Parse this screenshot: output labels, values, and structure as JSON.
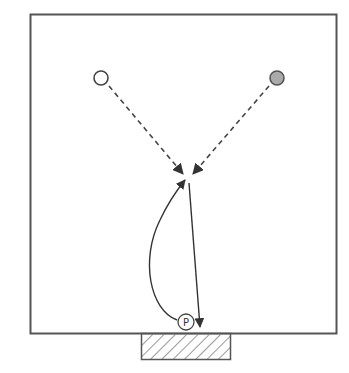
{
  "diagram": {
    "type": "play-diagram",
    "court": {
      "x": 30,
      "y": 14,
      "width": 306,
      "height": 319,
      "stroke": "#555555"
    },
    "goal_zone": {
      "x": 141,
      "y": 333,
      "width": 89,
      "height": 26,
      "pattern": "hatched",
      "stroke": "#555555"
    },
    "players": [
      {
        "id": "white-player",
        "cx": 101,
        "cy": 78,
        "r": 7,
        "fill": "#ffffff",
        "stroke": "#444444"
      },
      {
        "id": "gray-player",
        "cx": 277,
        "cy": 78,
        "r": 7,
        "fill": "#aaaaaa",
        "stroke": "#555555"
      },
      {
        "id": "p-player",
        "cx": 186,
        "cy": 322,
        "r": 8,
        "fill": "#ffffff",
        "stroke": "#444444",
        "label": "P"
      }
    ],
    "paths": [
      {
        "id": "dashed-from-white",
        "style": "dashed",
        "from": [
          109,
          86
        ],
        "to": [
          184,
          175
        ]
      },
      {
        "id": "dashed-from-gray",
        "style": "dashed",
        "from": [
          269,
          86
        ],
        "to": [
          192,
          175
        ]
      },
      {
        "id": "curved-pass",
        "style": "solid-curve",
        "from": [
          177,
          320
        ],
        "to": [
          185,
          180
        ]
      },
      {
        "id": "straight-shot",
        "style": "solid",
        "from": [
          189,
          183
        ],
        "to": [
          200,
          328
        ]
      }
    ]
  }
}
